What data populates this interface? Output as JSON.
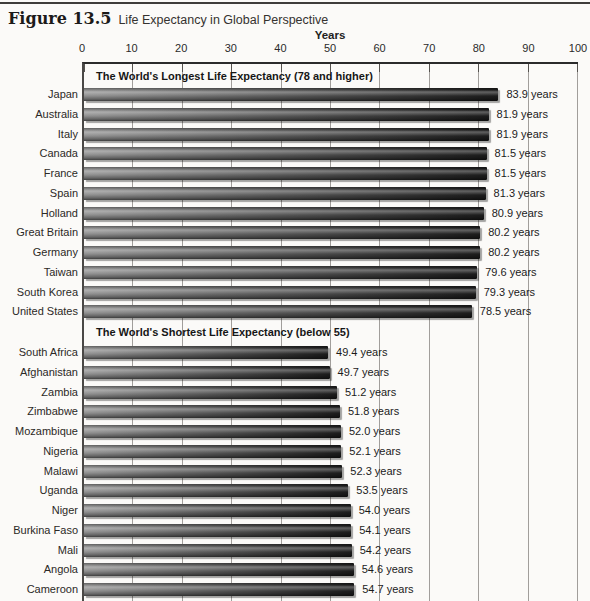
{
  "figure": {
    "label": "Figure 13.5",
    "title": "Life Expectancy in Global Perspective"
  },
  "chart_data": {
    "type": "bar",
    "orientation": "horizontal",
    "axis_title": "Years",
    "ticks": [
      0,
      10,
      20,
      30,
      40,
      50,
      60,
      70,
      80,
      90,
      100
    ],
    "xlim": [
      0,
      100
    ],
    "grid": true,
    "legend": "none",
    "value_suffix": " years",
    "sections": [
      {
        "title": "The World's Longest Life Expectancy (78 and higher)",
        "categories": [
          "Japan",
          "Australia",
          "Italy",
          "Canada",
          "France",
          "Spain",
          "Holland",
          "Great Britain",
          "Germany",
          "Taiwan",
          "South Korea",
          "United States"
        ],
        "values": [
          83.9,
          81.9,
          81.9,
          81.5,
          81.5,
          81.3,
          80.9,
          80.2,
          80.2,
          79.6,
          79.3,
          78.5
        ]
      },
      {
        "title": "The World's Shortest Life Expectancy (below 55)",
        "categories": [
          "South Africa",
          "Afghanistan",
          "Zambia",
          "Zimbabwe",
          "Mozambique",
          "Nigeria",
          "Malawi",
          "Uganda",
          "Niger",
          "Burkina Faso",
          "Mali",
          "Angola",
          "Cameroon"
        ],
        "values": [
          49.4,
          49.7,
          51.2,
          51.8,
          52.0,
          52.1,
          52.3,
          53.5,
          54.0,
          54.1,
          54.2,
          54.6,
          54.7
        ]
      }
    ]
  },
  "colors": {
    "background": "#fbfaf8",
    "text": "#1d1d1d",
    "axis": "#2b2b2b",
    "gridline": "#a19e9b",
    "bar_gradient_left": "#909090",
    "bar_gradient_right": "#1c1c1c"
  }
}
